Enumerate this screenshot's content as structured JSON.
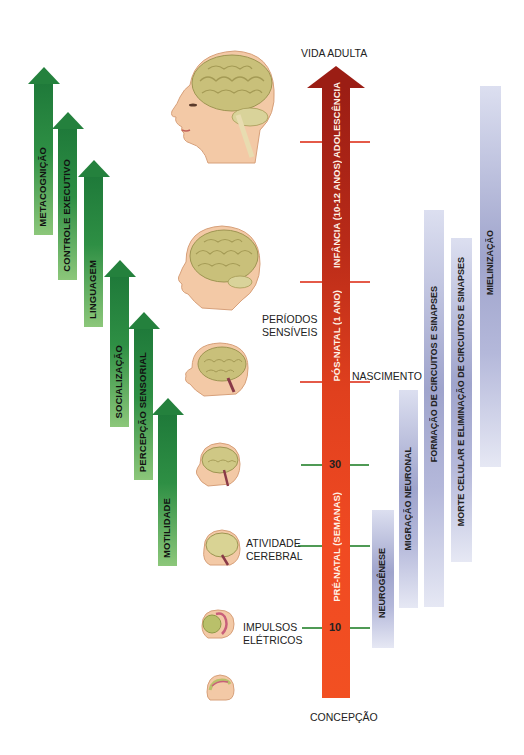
{
  "timeline": {
    "top_label": "VIDA ADULTA",
    "bottom_label": "CONCEPÇÃO",
    "phases": [
      {
        "label": "ADOLESCÊNCIA"
      },
      {
        "label": "INFÂNCIA (10-12 ANOS)"
      },
      {
        "label": "PÓS-NATAL (1 ANO)"
      },
      {
        "label": "PRÉ-NATAL (SEMANAS)"
      }
    ],
    "markers": [
      {
        "label": "NASCIMENTO"
      },
      {
        "value": "30"
      },
      {
        "label_line1": "ATIVIDADE",
        "label_line2": "CEREBRAL"
      },
      {
        "value": "10",
        "label_line1": "IMPULSOS",
        "label_line2": "ELÉTRICOS"
      }
    ],
    "sensitive_periods": {
      "line1": "PERÍODOS",
      "line2": "SENSÍVEIS"
    },
    "colors": {
      "arrow_top": "#9b1d14",
      "arrow_bottom": "#f25022",
      "tick_red": "#e45a48",
      "tick_green": "#4f9a55"
    }
  },
  "functions": {
    "color": "#24813d",
    "items": [
      {
        "label": "METACOGNIÇÃO"
      },
      {
        "label": "CONTROLE EXECUTIVO"
      },
      {
        "label": "LINGUAGEM"
      },
      {
        "label": "SOCIALIZAÇÃO"
      },
      {
        "label": "PERCEPÇÃO SENSORIAL"
      },
      {
        "label": "MOTILIDADE"
      }
    ]
  },
  "processes": {
    "color": "#9fa4cc",
    "items": [
      {
        "label": "NEUROGÊNESE"
      },
      {
        "label": "MIGRAÇÃO NEURONAL"
      },
      {
        "label": "FORMAÇÃO DE CIRCUITOS E SINAPSES"
      },
      {
        "label": "MORTE CELULAR E ELIMINAÇÃO DE CIRCUITOS E SINAPSES"
      },
      {
        "label": "MIELINIZAÇÃO"
      }
    ]
  },
  "illustrations": [
    {
      "icon": "adult-head-brain-icon"
    },
    {
      "icon": "child-head-brain-icon"
    },
    {
      "icon": "infant-head-brain-icon"
    },
    {
      "icon": "fetus-30-weeks-brain-icon"
    },
    {
      "icon": "fetus-brain-activity-icon"
    },
    {
      "icon": "embryo-10-weeks-icon"
    },
    {
      "icon": "embryo-conception-icon"
    }
  ]
}
